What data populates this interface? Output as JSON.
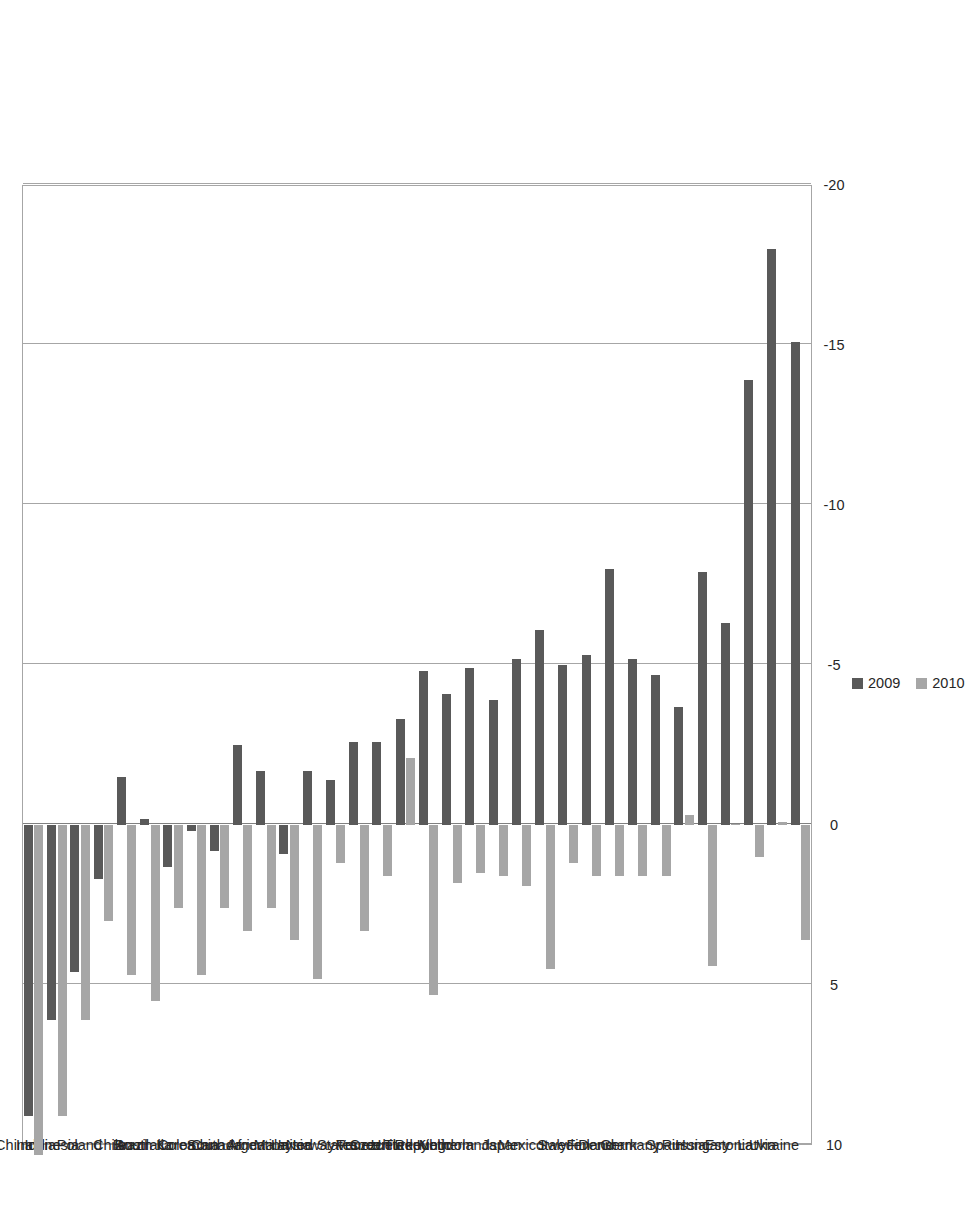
{
  "chart_data": {
    "type": "bar",
    "title": "",
    "subtitle": "",
    "xlabel": "",
    "ylabel": "",
    "orientation": "vertical-rotated-90",
    "grid": true,
    "legend_position": "right",
    "ylim": [
      -20,
      10
    ],
    "yticks": [
      10,
      5,
      0,
      -5,
      -10,
      -15,
      -20
    ],
    "ytick_labels": [
      "10",
      "5",
      "0",
      "-5",
      "-10",
      "-15",
      "-20"
    ],
    "categories": [
      "China",
      "India",
      "Indonesia",
      "Poland",
      "Chile",
      "Brazil",
      "Australia",
      "South Korea",
      "Colombia",
      "Canada",
      "South Africa",
      "Argentina",
      "Malaysia",
      "Norway",
      "United States",
      "France",
      "Venezuela",
      "Turkey",
      "Czech Republic",
      "United Kingdom",
      "Netherlands",
      "Japan",
      "Mexico",
      "Italy",
      "Sweden",
      "Finland",
      "Denmark",
      "Germany",
      "Spain",
      "Russia",
      "Hungary",
      "Estonia",
      "Latvia",
      "Ukraine"
    ],
    "series": [
      {
        "name": "2009",
        "color": "#595959",
        "values": [
          9.1,
          6.1,
          4.6,
          1.7,
          -1.5,
          -0.2,
          1.3,
          0.2,
          0.8,
          -2.5,
          -1.7,
          0.9,
          -1.7,
          -1.4,
          -2.6,
          -2.6,
          -3.3,
          -4.8,
          -4.1,
          -4.9,
          -3.9,
          -5.2,
          -6.1,
          -5.0,
          -5.3,
          -8.0,
          -5.2,
          -4.7,
          -3.7,
          -7.9,
          -6.3,
          -13.9,
          -18.0,
          -15.1
        ]
      },
      {
        "name": "2010",
        "color": "#a6a6a6",
        "values": [
          10.3,
          9.1,
          6.1,
          3.0,
          4.7,
          5.5,
          2.6,
          4.7,
          2.6,
          3.3,
          2.6,
          3.6,
          4.8,
          1.2,
          3.3,
          1.6,
          -2.1,
          5.3,
          1.8,
          1.5,
          1.6,
          1.9,
          4.5,
          1.2,
          1.6,
          1.6,
          1.6,
          1.6,
          -0.3,
          4.4,
          0.0,
          1.0,
          -0.1,
          3.6
        ]
      }
    ],
    "legend": [
      {
        "label": "2009",
        "color": "#595959"
      },
      {
        "label": "2010",
        "color": "#a6a6a6"
      }
    ]
  }
}
